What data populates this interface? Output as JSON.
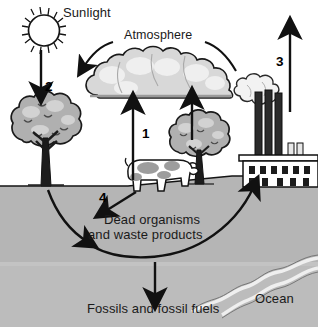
{
  "diagram": {
    "title_visible": false,
    "labels": {
      "sunlight": "Sunlight",
      "atmosphere": "Atmosphere",
      "dead_organisms_line1": "Dead organisms",
      "dead_organisms_line2": "and waste products",
      "fossils": "Fossils and fossil fuels",
      "ocean": "Ocean"
    },
    "numbered_arrows": [
      {
        "id": "1",
        "label": "1",
        "from": "dead-organisms-ground",
        "to": "atmosphere",
        "direction": "up"
      },
      {
        "id": "2",
        "label": "2",
        "from": "sunlight",
        "to": "left-tree",
        "direction": "down"
      },
      {
        "id": "3",
        "label": "3",
        "from": "factory-smokestacks",
        "to": "atmosphere",
        "direction": "up"
      },
      {
        "id": "4",
        "label": "4",
        "from": "cow",
        "to": "dead-organisms",
        "direction": "down-left"
      }
    ],
    "elements": [
      {
        "name": "sun",
        "icon": "sun-icon"
      },
      {
        "name": "cloud",
        "icon": "cloud-icon"
      },
      {
        "name": "left-tree",
        "icon": "tree-icon"
      },
      {
        "name": "right-tree",
        "icon": "tree-icon"
      },
      {
        "name": "cow",
        "icon": "cow-icon"
      },
      {
        "name": "factory",
        "icon": "factory-icon"
      },
      {
        "name": "smoke",
        "icon": "smoke-icon"
      },
      {
        "name": "ocean-water",
        "icon": "river-icon"
      }
    ],
    "colors": {
      "ink": "#1a1a1a",
      "ground": "#b5b5b5",
      "subsurface": "#bcbcbc",
      "foliage": "#a8a8a8",
      "foliage_light": "#c9c9c9",
      "cloud_light": "#e2e2e2",
      "cloud_mid": "#c4c4c4",
      "paper": "#ffffff",
      "smoke": "#efefef"
    }
  }
}
